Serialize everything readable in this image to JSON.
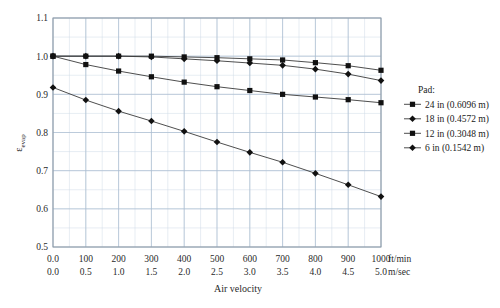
{
  "chart_data": {
    "type": "line",
    "title": "",
    "xlabel": "Air velocity",
    "ylabel": "εevap",
    "ylabel_main": "ε",
    "ylabel_sub": "evap",
    "xlim": [
      0,
      1000
    ],
    "ylim": [
      0.5,
      1.1
    ],
    "grid": true,
    "legend_position": "right",
    "legend_title": "Pad:",
    "x_unit_primary": "ft/min",
    "x_unit_secondary": "m/sec",
    "x_ticks_primary": [
      "0.0",
      "100",
      "200",
      "300",
      "400",
      "500",
      "600",
      "700",
      "800",
      "900",
      "1000"
    ],
    "x_ticks_secondary": [
      "0.0",
      "0.5",
      "1.0",
      "1.5",
      "2.0",
      "2.5",
      "3.0",
      "3.5",
      "4.0",
      "4.5",
      "5.0"
    ],
    "x_tick_values": [
      0,
      100,
      200,
      300,
      400,
      500,
      600,
      700,
      800,
      900,
      1000
    ],
    "y_ticks": [
      "1.1",
      "1.0",
      "0.9",
      "0.8",
      "0.7",
      "0.6",
      "0.5"
    ],
    "y_tick_values": [
      1.1,
      1.0,
      0.9,
      0.8,
      0.7,
      0.6,
      0.5
    ],
    "x": [
      0,
      100,
      200,
      300,
      400,
      500,
      600,
      700,
      800,
      900,
      1000
    ],
    "series": [
      {
        "name": "24 in (0.6096 m)",
        "marker": "square",
        "values": [
          1.0,
          1.0,
          1.0,
          1.0,
          0.998,
          0.996,
          0.993,
          0.99,
          0.983,
          0.975,
          0.963
        ]
      },
      {
        "name": "18 in (0.4572 m)",
        "marker": "diamond",
        "values": [
          1.0,
          1.0,
          1.0,
          0.998,
          0.993,
          0.988,
          0.982,
          0.976,
          0.966,
          0.953,
          0.936
        ]
      },
      {
        "name": "12 in (0.3048 m)",
        "marker": "square",
        "values": [
          1.0,
          0.978,
          0.961,
          0.946,
          0.932,
          0.92,
          0.91,
          0.9,
          0.893,
          0.886,
          0.878
        ]
      },
      {
        "name": "6 in (0.1542 m)",
        "marker": "diamond",
        "values": [
          0.918,
          0.885,
          0.856,
          0.83,
          0.803,
          0.775,
          0.748,
          0.722,
          0.693,
          0.663,
          0.632
        ]
      }
    ],
    "colors": {
      "line": "#3a3a3a",
      "marker": "#111111",
      "grid_major": "#a9bcd0",
      "grid_minor": "#cfdae6",
      "axis": "#9aa6b2",
      "background": "#ffffff"
    }
  },
  "legend": {
    "title": "Pad:",
    "items": [
      {
        "label": "24 in (0.6096 m)",
        "marker": "square"
      },
      {
        "label": "18 in (0.4572 m)",
        "marker": "diamond"
      },
      {
        "label": "12 in (0.3048 m)",
        "marker": "square"
      },
      {
        "label": "6 in (0.1542 m)",
        "marker": "diamond"
      }
    ]
  }
}
